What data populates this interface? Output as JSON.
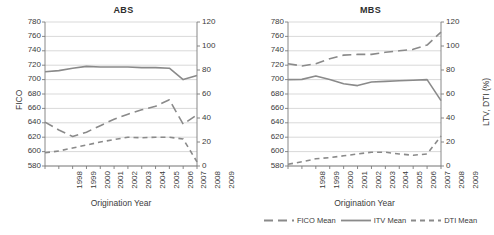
{
  "figure": {
    "panels": [
      "ABS",
      "MBS"
    ],
    "axis_color": "#7a7a7a",
    "grid_color": "#c9c9c9",
    "series_color": "#8a8a8a"
  },
  "legend": {
    "position": "bottom-right",
    "items": [
      {
        "label": "FICO Mean",
        "icon": "long-dash-line-swatch",
        "dash": "9,5"
      },
      {
        "label": "ITV Mean",
        "icon": "solid-line-swatch",
        "dash": "0"
      },
      {
        "label": "DTI Mean",
        "icon": "short-dash-line-swatch",
        "dash": "5,4"
      }
    ]
  },
  "chart_data": [
    {
      "type": "line",
      "title": "ABS",
      "xlabel": "Origination Year",
      "ylabel": "FICO",
      "y2label": "",
      "grid": true,
      "x": [
        1998,
        1999,
        2000,
        2001,
        2002,
        2003,
        2004,
        2005,
        2006,
        2007,
        2008,
        2009
      ],
      "xticklabels": [
        "1998",
        "1999",
        "2000",
        "2001",
        "2002",
        "2003",
        "2004",
        "2005",
        "2006",
        "2007",
        "2008",
        "2009"
      ],
      "ylim": [
        580,
        780
      ],
      "yticks": [
        580,
        600,
        620,
        640,
        660,
        680,
        700,
        720,
        740,
        760,
        780
      ],
      "y2lim": [
        0,
        120
      ],
      "y2ticks": [
        0,
        20,
        40,
        60,
        80,
        100,
        120
      ],
      "series": [
        {
          "name": "FICO Mean",
          "axis": "left",
          "style": "long-dash",
          "values": [
            641,
            630,
            621,
            627,
            636,
            645,
            652,
            658,
            663,
            672,
            638,
            651
          ]
        },
        {
          "name": "ITV Mean",
          "axis": "right",
          "style": "solid",
          "values": [
            78.5,
            79.5,
            81.5,
            83.0,
            82.5,
            82.5,
            82.5,
            82.0,
            82.0,
            81.5,
            72.0,
            75.5
          ]
        },
        {
          "name": "DTI Mean",
          "axis": "right",
          "style": "short-dash",
          "values": [
            11.0,
            12.5,
            15.0,
            17.5,
            20.0,
            22.0,
            24.0,
            23.5,
            24.0,
            24.0,
            22.5,
            3.5
          ]
        }
      ]
    },
    {
      "type": "line",
      "title": "MBS",
      "xlabel": "Origination Year",
      "ylabel": "",
      "y2label": "LTV, DTI (%)",
      "grid": true,
      "x": [
        1998,
        1999,
        2000,
        2001,
        2002,
        2003,
        2004,
        2005,
        2006,
        2007,
        2008,
        2009
      ],
      "xticklabels": [
        "1998",
        "1999",
        "2000",
        "2001",
        "2002",
        "2003",
        "2004",
        "2005",
        "2006",
        "2007",
        "2008",
        "2009"
      ],
      "ylim": [
        580,
        780
      ],
      "yticks": [
        580,
        600,
        620,
        640,
        660,
        680,
        700,
        720,
        740,
        760,
        780
      ],
      "y2lim": [
        0,
        120
      ],
      "y2ticks": [
        0,
        20,
        40,
        60,
        80,
        100,
        120
      ],
      "series": [
        {
          "name": "FICO Mean",
          "axis": "left",
          "style": "long-dash",
          "values": [
            722,
            719,
            722,
            729,
            734,
            735,
            735,
            738,
            740,
            742,
            748,
            766
          ]
        },
        {
          "name": "ITV Mean",
          "axis": "right",
          "style": "solid",
          "values": [
            72.0,
            72.2,
            75.0,
            72.0,
            68.5,
            67.0,
            70.0,
            70.5,
            71.0,
            71.5,
            72.0,
            54.5
          ]
        },
        {
          "name": "DTI Mean",
          "axis": "right",
          "style": "short-dash",
          "values": [
            1.5,
            3.5,
            6.0,
            7.0,
            8.5,
            10.0,
            11.5,
            11.5,
            10.0,
            9.0,
            10.0,
            25.0
          ]
        }
      ]
    }
  ]
}
